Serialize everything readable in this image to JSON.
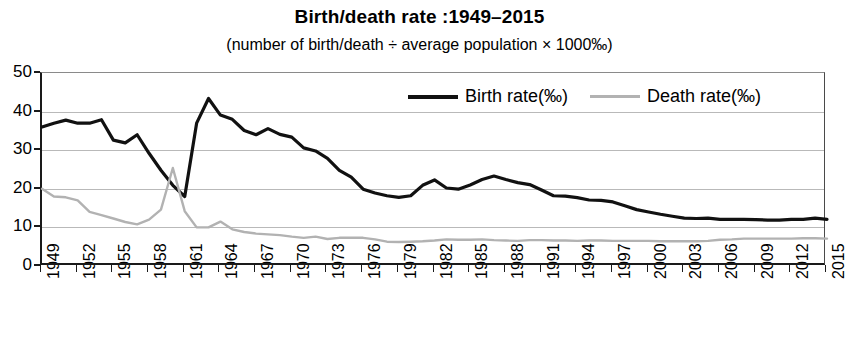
{
  "chart_data": {
    "type": "line",
    "title": "Birth/death rate :1949–2015",
    "subtitle": "(number of birth/death ÷ average population × 1000‰)",
    "xlabel": "",
    "ylabel": "",
    "ylim": [
      0,
      50
    ],
    "yticks": [
      0,
      10,
      20,
      30,
      40,
      50
    ],
    "grid": true,
    "legend_position": "top-right-inside",
    "x": [
      1949,
      1950,
      1951,
      1952,
      1953,
      1954,
      1955,
      1956,
      1957,
      1958,
      1959,
      1960,
      1961,
      1962,
      1963,
      1964,
      1965,
      1966,
      1967,
      1968,
      1969,
      1970,
      1971,
      1972,
      1973,
      1974,
      1975,
      1976,
      1977,
      1978,
      1979,
      1980,
      1981,
      1982,
      1983,
      1984,
      1985,
      1986,
      1987,
      1988,
      1989,
      1990,
      1991,
      1992,
      1993,
      1994,
      1995,
      1996,
      1997,
      1998,
      1999,
      2000,
      2001,
      2002,
      2003,
      2004,
      2005,
      2006,
      2007,
      2008,
      2009,
      2010,
      2011,
      2012,
      2013,
      2014,
      2015
    ],
    "xticks": [
      1949,
      1952,
      1955,
      1958,
      1961,
      1964,
      1967,
      1970,
      1973,
      1976,
      1979,
      1982,
      1985,
      1988,
      1991,
      1994,
      1997,
      2000,
      2003,
      2006,
      2009,
      2012,
      2015
    ],
    "series": [
      {
        "name": "Birth rate(‰)",
        "color": "#111111",
        "values": [
          36.0,
          37.0,
          37.8,
          37.0,
          37.0,
          37.9,
          32.6,
          31.9,
          34.0,
          29.2,
          24.8,
          20.9,
          18.0,
          37.0,
          43.4,
          39.1,
          38.0,
          35.1,
          34.0,
          35.6,
          34.1,
          33.4,
          30.6,
          29.8,
          27.9,
          24.8,
          23.0,
          19.9,
          18.9,
          18.2,
          17.8,
          18.2,
          20.9,
          22.3,
          20.2,
          19.9,
          21.0,
          22.4,
          23.3,
          22.4,
          21.6,
          21.1,
          19.7,
          18.2,
          18.1,
          17.7,
          17.1,
          17.0,
          16.6,
          15.6,
          14.6,
          14.0,
          13.4,
          12.9,
          12.4,
          12.3,
          12.4,
          12.1,
          12.1,
          12.1,
          12.0,
          11.9,
          11.9,
          12.1,
          12.1,
          12.4,
          12.1
        ],
        "line_width": 3.2
      },
      {
        "name": "Death rate(‰)",
        "color": "#b2b2b2",
        "values": [
          20.0,
          18.0,
          17.8,
          17.0,
          14.0,
          13.2,
          12.3,
          11.4,
          10.8,
          12.0,
          14.6,
          25.4,
          14.2,
          10.0,
          10.0,
          11.5,
          9.5,
          8.8,
          8.4,
          8.2,
          8.0,
          7.6,
          7.3,
          7.6,
          7.0,
          7.3,
          7.3,
          7.3,
          6.9,
          6.3,
          6.2,
          6.3,
          6.4,
          6.6,
          6.9,
          6.8,
          6.8,
          6.9,
          6.7,
          6.6,
          6.5,
          6.7,
          6.7,
          6.6,
          6.6,
          6.5,
          6.6,
          6.6,
          6.5,
          6.5,
          6.5,
          6.5,
          6.4,
          6.4,
          6.4,
          6.4,
          6.5,
          6.8,
          6.9,
          7.1,
          7.1,
          7.1,
          7.1,
          7.1,
          7.2,
          7.2,
          7.1
        ],
        "line_width": 2.4
      }
    ]
  },
  "legend": {
    "birth_label": "Birth rate(‰)",
    "death_label": "Death rate(‰)"
  },
  "axis": {
    "y_labels": [
      "50",
      "40",
      "30",
      "20",
      "10",
      "0"
    ],
    "x_labels": [
      "1949",
      "1952",
      "1955",
      "1958",
      "1961",
      "1964",
      "1967",
      "1970",
      "1973",
      "1976",
      "1979",
      "1982",
      "1985",
      "1988",
      "1991",
      "1994",
      "1997",
      "2000",
      "2003",
      "2006",
      "2009",
      "2012",
      "2015"
    ]
  }
}
